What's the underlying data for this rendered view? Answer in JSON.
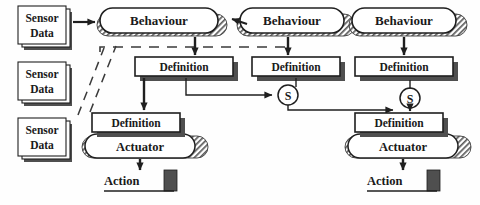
{
  "diagram": {
    "colors": {
      "ink": "#1f1f1f",
      "shadow": "#4a4a4a",
      "fill": "#ffffff",
      "hatch": "#6e6e6e",
      "paper": "#fefefe"
    },
    "sensor_nodes": [
      {
        "id": "sensor1",
        "line1": "Sensor",
        "line2": "Data",
        "x": 18,
        "y": 6,
        "w": 48,
        "h": 38
      },
      {
        "id": "sensor2",
        "line1": "Sensor",
        "line2": "Data",
        "x": 18,
        "y": 62,
        "w": 48,
        "h": 38
      },
      {
        "id": "sensor3",
        "line1": "Sensor",
        "line2": "Data",
        "x": 18,
        "y": 118,
        "w": 48,
        "h": 38
      }
    ],
    "behaviour_nodes": [
      {
        "id": "behaviour1",
        "label": "Behaviour",
        "cx": 159,
        "cy": 20,
        "w": 118,
        "h": 25
      },
      {
        "id": "behaviour2",
        "label": "Behaviour",
        "cx": 292,
        "cy": 20,
        "w": 104,
        "h": 25
      },
      {
        "id": "behaviour3",
        "label": "Behaviour",
        "cx": 404,
        "cy": 20,
        "w": 104,
        "h": 25
      }
    ],
    "definition_nodes": [
      {
        "id": "definition1",
        "label": "Definition",
        "x": 135,
        "y": 57,
        "w": 98,
        "h": 19
      },
      {
        "id": "definition2",
        "label": "Definition",
        "x": 252,
        "y": 57,
        "w": 88,
        "h": 19
      },
      {
        "id": "definition3",
        "label": "Definition",
        "x": 355,
        "y": 57,
        "w": 98,
        "h": 19
      },
      {
        "id": "definition4",
        "label": "Definition",
        "x": 92,
        "y": 113,
        "w": 88,
        "h": 19
      },
      {
        "id": "definition5",
        "label": "Definition",
        "x": 355,
        "y": 113,
        "w": 88,
        "h": 19
      }
    ],
    "actuator_nodes": [
      {
        "id": "actuator1",
        "label": "Actuator",
        "cx": 140,
        "cy": 146,
        "w": 110,
        "h": 24
      },
      {
        "id": "actuator2",
        "label": "Actuator",
        "cx": 403,
        "cy": 146,
        "w": 110,
        "h": 24
      }
    ],
    "selector_nodes": [
      {
        "id": "selector1",
        "label": "S",
        "cx": 288,
        "cy": 95,
        "r": 10
      },
      {
        "id": "selector2",
        "label": "S",
        "cx": 410,
        "cy": 98,
        "r": 10
      }
    ],
    "action_nodes": [
      {
        "id": "action1",
        "label": "Action",
        "x": 104,
        "y": 172,
        "underline_w": 70
      },
      {
        "id": "action2",
        "label": "Action",
        "x": 367,
        "y": 172,
        "underline_w": 70
      }
    ],
    "edge_notes": {
      "sensor_to_behaviour": "solid arrow",
      "behaviour_to_definition": "solid arrow down",
      "definition_to_selector": "solid arrow",
      "selector_to_definition": "solid arrow",
      "actuator_to_action": "solid arrow down",
      "inhibition_link": "dashed line",
      "behaviour_chain": "arrow pointing left into behaviour"
    }
  }
}
